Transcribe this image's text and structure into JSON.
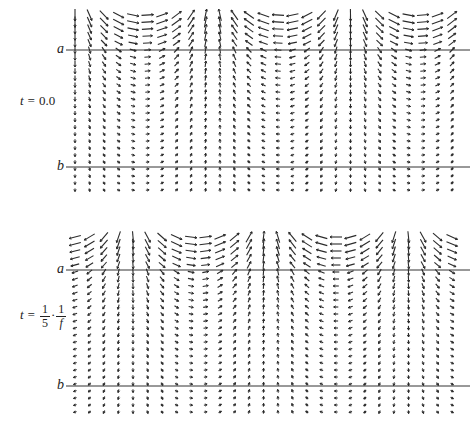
{
  "figure": {
    "type": "vector-field",
    "grid": {
      "columns": 27,
      "rows": 26,
      "x_start": 75,
      "x_step": 14.5,
      "row_step": 7
    },
    "line_color": "#333333",
    "arrow_color": "#2a2a2a"
  },
  "panels": [
    {
      "id": "top",
      "top": 0,
      "time_label": {
        "prefix": "t = ",
        "value": "0.0"
      },
      "line_a": {
        "label": "a",
        "y": 50
      },
      "line_b": {
        "label": "b",
        "y": 167
      },
      "row_start_y": 15,
      "phase": 0.0
    },
    {
      "id": "bottom",
      "top": 0,
      "time_label": {
        "prefix": "t = ",
        "frac1_num": "1",
        "frac1_den": "5",
        "dot": "·",
        "frac2_num": "1",
        "frac2_den": "f"
      },
      "line_a": {
        "label": "a",
        "y": 270
      },
      "line_b": {
        "label": "b",
        "y": 386
      },
      "row_start_y": 237,
      "phase": 1.2566
    }
  ],
  "chart_data": {
    "type": "quiver",
    "title": "",
    "panels": [
      {
        "label": "t = 0.0",
        "boundaries": [
          "a",
          "b"
        ]
      },
      {
        "label": "t = 1/5 · 1/f",
        "boundaries": [
          "a",
          "b"
        ]
      }
    ],
    "xlabel": "",
    "ylabel": "",
    "grid": false
  }
}
